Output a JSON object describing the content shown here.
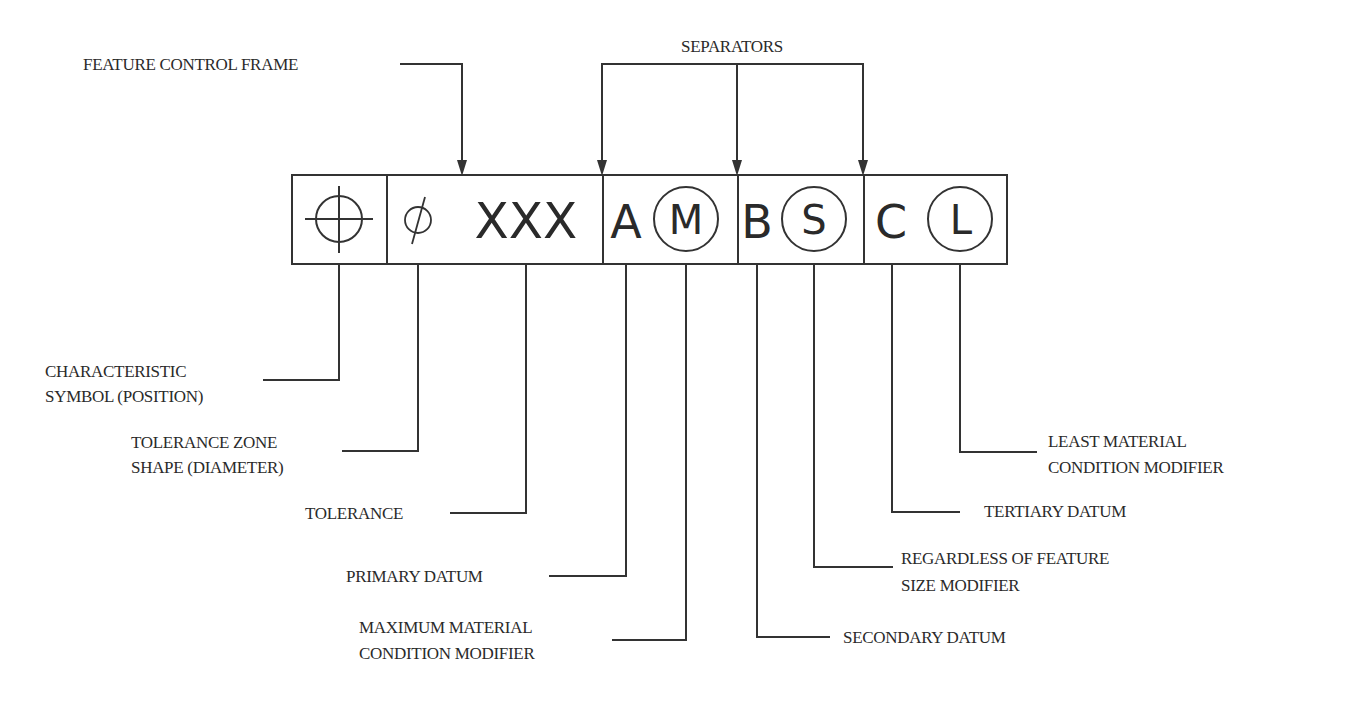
{
  "diagram": {
    "title": "Feature Control Frame",
    "colors": {
      "line": "#333333",
      "text": "#2a2a2a",
      "background": "#ffffff"
    },
    "frame": {
      "cells": [
        {
          "id": "characteristic",
          "symbol": "position-symbol",
          "text": ""
        },
        {
          "id": "tolerance",
          "diameter_symbol": "Ø",
          "value": "XXX"
        },
        {
          "id": "datum-a",
          "datum": "A",
          "modifier": "M"
        },
        {
          "id": "datum-b",
          "datum": "B",
          "modifier": "S"
        },
        {
          "id": "datum-c",
          "datum": "C",
          "modifier": "L"
        }
      ]
    },
    "callouts_top": {
      "feature_control_frame": "FEATURE CONTROL FRAME",
      "separators": "SEPARATORS"
    },
    "callouts_bottom": {
      "characteristic_symbol": [
        "CHARACTERISTIC",
        "SYMBOL (POSITION)"
      ],
      "tolerance_zone_shape": [
        "TOLERANCE ZONE",
        "SHAPE (DIAMETER)"
      ],
      "tolerance": "TOLERANCE",
      "primary_datum": "PRIMARY DATUM",
      "mmc_modifier": [
        "MAXIMUM MATERIAL",
        "CONDITION MODIFIER"
      ],
      "secondary_datum": "SECONDARY DATUM",
      "rfs_modifier": [
        "REGARDLESS OF FEATURE",
        "SIZE MODIFIER"
      ],
      "tertiary_datum": "TERTIARY DATUM",
      "lmc_modifier": [
        "LEAST MATERIAL",
        "CONDITION MODIFIER"
      ]
    }
  }
}
